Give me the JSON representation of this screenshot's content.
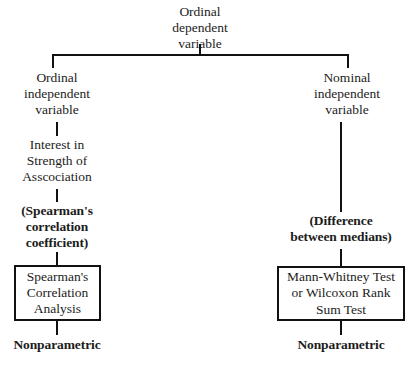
{
  "diagram": {
    "line_color": "#111111",
    "text_color": "#1c1c1c",
    "background_color": "#ffffff"
  },
  "nodes": {
    "root": {
      "label": "Ordinal\ndependent\nvariable"
    },
    "left_branch": {
      "independent_variable": "Ordinal\nindependent\nvariable",
      "interest": "Interest in\nStrength of\nAsscociation",
      "statistic": "(Spearman's\ncorrelation\ncoefficient)",
      "test_box": "Spearman's\nCorrelation\nAnalysis",
      "classification": "Nonparametric"
    },
    "right_branch": {
      "independent_variable": "Nominal\nindependent\nvariable",
      "statistic": "(Difference\nbetween medians)",
      "test_box": "Mann-Whitney Test\nor Wilcoxon Rank\nSum Test",
      "classification": "Nonparametric"
    }
  }
}
